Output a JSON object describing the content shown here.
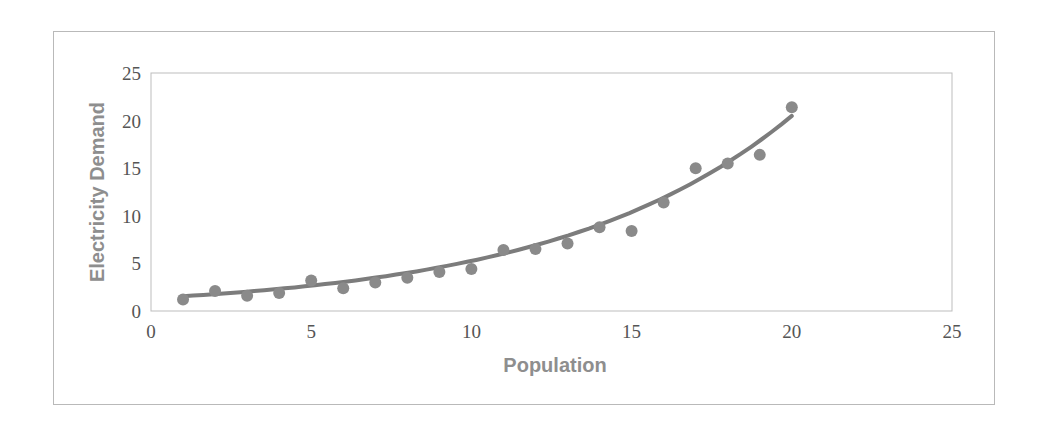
{
  "chart_data": {
    "type": "scatter",
    "title": "",
    "xlabel": "Population",
    "ylabel": "Electricity Demand",
    "xlim": [
      0,
      25
    ],
    "ylim": [
      0,
      25
    ],
    "xticks": [
      0,
      5,
      10,
      15,
      20,
      25
    ],
    "yticks": [
      0,
      5,
      10,
      15,
      20,
      25
    ],
    "grid": false,
    "legend": null,
    "series": [
      {
        "name": "Electricity Demand",
        "kind": "scatter",
        "color": "#8a8a8a",
        "x": [
          1,
          2,
          3,
          4,
          5,
          6,
          7,
          8,
          9,
          10,
          11,
          12,
          13,
          14,
          15,
          16,
          17,
          18,
          19,
          20
        ],
        "y": [
          1.2,
          2.1,
          1.6,
          1.9,
          3.2,
          2.4,
          3.0,
          3.5,
          4.1,
          4.4,
          6.4,
          6.5,
          7.1,
          8.8,
          8.4,
          11.4,
          15.0,
          15.5,
          16.4,
          21.4
        ]
      },
      {
        "name": "Exponential trendline",
        "kind": "line",
        "color": "#7c7c7c",
        "equation": "y = 1.35 * e^(0.136x)",
        "x_range": [
          1,
          20
        ],
        "a": 1.35,
        "b": 0.136
      }
    ]
  }
}
